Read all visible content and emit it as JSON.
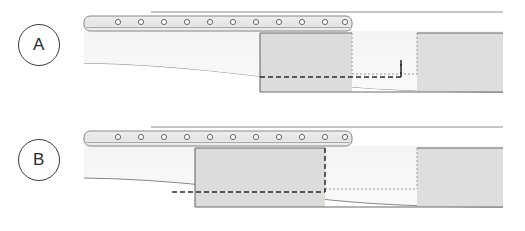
{
  "figure": {
    "type": "technical-cross-section-diagram",
    "width": 525,
    "height": 231,
    "background": "#ffffff",
    "panel_count": 2
  },
  "colors": {
    "background": "#ffffff",
    "outline": "#6e6e6e",
    "outline_dark": "#4a4a4a",
    "label_stroke": "#3a3a3a",
    "label_text": "#2b2b2b",
    "substrate_fill": "#f2f2f1",
    "substrate_fill_light": "#f6f6f5",
    "strip_fill": "#e6e6e5",
    "strip_fill_top": "#efefee",
    "block_fill": "#dcdcda",
    "block_fill_right": "#dedede",
    "dashed_line": "#2a2a2a",
    "dotted_line": "#9a9a9a",
    "rivet_stroke": "#5a5a5a",
    "rivet_fill": "#fafafa",
    "thin_rule": "#8c8c8c"
  },
  "panels": [
    {
      "id": "A",
      "label": "A",
      "label_name": "panel-label-a",
      "description": "Upper cross-section view with fastener strip and stepped gray block offset to the right",
      "strip": {
        "x_start": 84,
        "x_end": 352,
        "y_top": 16,
        "y_bottom": 31,
        "rivet_count": 11,
        "rivet_radius": 2.6,
        "rivet_x": [
          118,
          141,
          164,
          187,
          210,
          233,
          256,
          279,
          302,
          325,
          345
        ],
        "rivet_y": 22
      },
      "upper_rule": {
        "x_start": 151,
        "x_end": 503,
        "y": 12
      },
      "substrate": {
        "x_start": 84,
        "x_end": 503,
        "y_top": 31,
        "curve_y_left": 63,
        "curve_y_right": 90
      },
      "left_block": {
        "x_start": 260,
        "x_end": 352,
        "y_top": 33,
        "y_bottom": 92,
        "step_x": 352,
        "step_y": 74
      },
      "notch": {
        "x_start": 352,
        "x_end": 417,
        "y_top": 74,
        "y_bottom": 92
      },
      "right_block": {
        "x_start": 417,
        "x_end": 503,
        "y_top": 33,
        "y_bottom": 92
      },
      "dashed_path_y": 77,
      "dashed_path_x_start": 260,
      "dashed_path_x_end": 401
    },
    {
      "id": "B",
      "label": "B",
      "label_name": "panel-label-b",
      "description": "Lower cross-section view with fastener strip and gray block extended further left",
      "strip": {
        "x_start": 84,
        "x_end": 352,
        "y_top": 16,
        "y_bottom": 31,
        "rivet_count": 11,
        "rivet_radius": 2.6,
        "rivet_x": [
          118,
          141,
          164,
          187,
          210,
          233,
          256,
          279,
          302,
          325,
          345
        ],
        "rivet_y": 22
      },
      "upper_rule": {
        "x_start": 151,
        "x_end": 503,
        "y": 12
      },
      "substrate": {
        "x_start": 84,
        "x_end": 503,
        "y_top": 31,
        "curve_y_left": 63,
        "curve_y_right": 90
      },
      "left_block": {
        "x_start": 195,
        "x_end": 325,
        "y_top": 33,
        "y_bottom": 92,
        "step_x": 325,
        "step_y": 74
      },
      "notch": {
        "x_start": 325,
        "x_end": 417,
        "y_top": 74,
        "y_bottom": 92
      },
      "right_block": {
        "x_start": 417,
        "x_end": 503,
        "y_top": 33,
        "y_bottom": 92
      },
      "dashed_path_y": 77,
      "dashed_path_x_start": 195,
      "dashed_path_x_end": 325
    }
  ]
}
